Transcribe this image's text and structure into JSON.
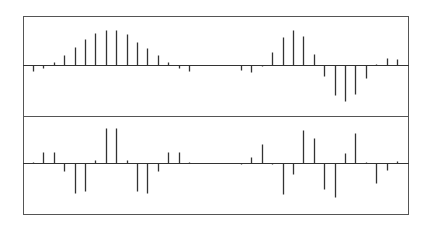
{
  "chart_data": [
    {
      "type": "stem",
      "panel": "top",
      "title": "",
      "xlabel": "",
      "ylabel": "",
      "grid": false,
      "legend": null,
      "x_start_px": 33,
      "x_step_px": 10.4,
      "ylim": [
        -45,
        45
      ],
      "series": [
        {
          "name": "upper signal",
          "x": [
            0,
            1,
            2,
            3,
            4,
            5,
            6,
            7,
            8,
            9,
            10,
            11,
            12,
            13,
            14,
            15,
            20,
            21,
            22,
            23,
            24,
            25,
            26,
            27,
            28,
            29,
            30,
            31,
            32,
            33,
            34,
            35
          ],
          "values": [
            -6,
            -3,
            3,
            10,
            18,
            26,
            32,
            35,
            35,
            31,
            23,
            17,
            10,
            3,
            -3,
            -6,
            -5,
            -7,
            -1,
            13,
            28,
            35,
            29,
            11,
            -11,
            -30,
            -36,
            -29,
            -13,
            0,
            7,
            6
          ]
        }
      ]
    },
    {
      "type": "stem",
      "panel": "bottom",
      "title": "",
      "xlabel": "",
      "ylabel": "",
      "grid": false,
      "legend": null,
      "x_start_px": 33,
      "x_step_px": 10.4,
      "ylim": [
        -45,
        45
      ],
      "series": [
        {
          "name": "lower signal",
          "x": [
            0,
            1,
            2,
            3,
            4,
            5,
            6,
            7,
            8,
            9,
            10,
            11,
            12,
            13,
            14,
            15,
            20,
            21,
            22,
            23,
            24,
            25,
            26,
            27,
            28,
            29,
            30,
            31,
            32,
            33,
            34,
            35
          ],
          "values": [
            1,
            11,
            11,
            -8,
            -30,
            -28,
            3,
            35,
            35,
            3,
            -28,
            -30,
            -8,
            11,
            11,
            1,
            -1,
            6,
            19,
            -1,
            -31,
            -11,
            33,
            25,
            -26,
            -34,
            10,
            30,
            1,
            -20,
            -7,
            2
          ]
        }
      ]
    }
  ],
  "style": {
    "frame_color": "#555555",
    "stem_color": "#333333",
    "axis_color": "#333333",
    "background": "#ffffff"
  }
}
